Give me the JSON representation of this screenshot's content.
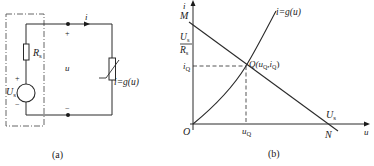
{
  "figure_a": {
    "caption": "(a)",
    "source_voltage": "U",
    "source_voltage_sub": "s",
    "source_plus": "+",
    "source_minus": "−",
    "resistor": "R",
    "resistor_sub": "s",
    "current": "i",
    "port_voltage": "u",
    "terminal_plus": "+",
    "terminal_minus": "−",
    "nonlinear_label": "i=g(u)"
  },
  "figure_b": {
    "caption": "(b)",
    "y_axis": "i",
    "x_axis": "u",
    "origin": "O",
    "point_M": "M",
    "point_N": "N",
    "intercept_y_num": "U",
    "intercept_y_num_sub": "s",
    "intercept_y_den": "R",
    "intercept_y_den_sub": "s",
    "intercept_x": "U",
    "intercept_x_sub": "s",
    "iQ": "i",
    "iQ_sub": "Q",
    "uQ": "u",
    "uQ_sub": "Q",
    "q_point": "Q(u",
    "q_point_sub1": "Q",
    "q_point_mid": ",i",
    "q_point_sub2": "Q",
    "q_point_end": ")",
    "curve_label": "i=g(u)"
  },
  "colors": {
    "line": "#2a2a2a",
    "dash_box": "#555555",
    "background": "#ffffff"
  }
}
